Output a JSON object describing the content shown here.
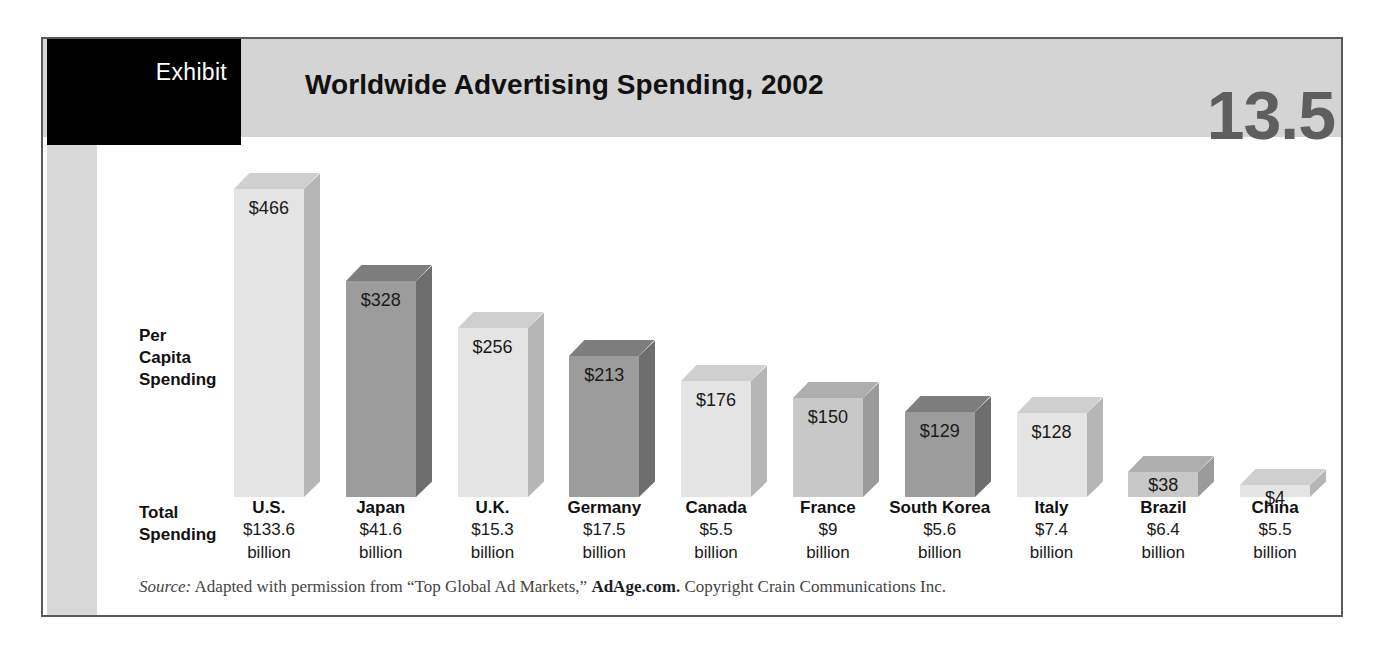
{
  "exhibit": {
    "label": "Exhibit",
    "number": "13.5",
    "title": "Worldwide Advertising Spending, 2002"
  },
  "axis": {
    "per_capita_label": "Per\nCapita\nSpending",
    "total_label": "Total\nSpending"
  },
  "source": {
    "prefix": "Source:",
    "text_before": " Adapted with permission from “Top Global Ad Markets,” ",
    "strong": "AdAge.com.",
    "text_after": " Copyright Crain Communications Inc."
  },
  "colors": {
    "frame_border": "#5a5a5a",
    "header_band": "#d4d4d4",
    "tab_black": "#000000",
    "number_gray": "#5e5e5e",
    "spine_gray": "#d8d8d8",
    "bar_light_front": "#e4e4e4",
    "bar_light_top": "#cfcfcf",
    "bar_light_side": "#b6b6b6",
    "bar_dark_front": "#9c9c9c",
    "bar_dark_top": "#7d7d7d",
    "bar_dark_side": "#6e6e6e",
    "bar_mid_front": "#c8c8c8",
    "bar_mid_top": "#aeaeae",
    "bar_mid_side": "#9b9b9b"
  },
  "chart_data": {
    "type": "bar",
    "title": "Worldwide Advertising Spending, 2002",
    "xlabel": "",
    "ylabel": "Per Capita Spending",
    "ylim": [
      0,
      500
    ],
    "grid": false,
    "legend": "none",
    "categories": [
      "U.S.",
      "Japan",
      "U.K.",
      "Germany",
      "Canada",
      "France",
      "South Korea",
      "Italy",
      "Brazil",
      "China"
    ],
    "values": [
      466,
      328,
      256,
      213,
      176,
      150,
      129,
      128,
      38,
      4
    ],
    "value_labels": [
      "$466",
      "$328",
      "$256",
      "$213",
      "$176",
      "$150",
      "$129",
      "$128",
      "$38",
      "$4"
    ],
    "total_spending": [
      "$133.6",
      "$41.6",
      "$15.3",
      "$17.5",
      "$5.5",
      "$9",
      "$5.6",
      "$7.4",
      "$6.4",
      "$5.5"
    ],
    "total_spending_unit": "billion",
    "bar_shades": [
      "light",
      "dark",
      "light",
      "dark",
      "light",
      "mid",
      "dark",
      "light",
      "mid",
      "light"
    ]
  }
}
